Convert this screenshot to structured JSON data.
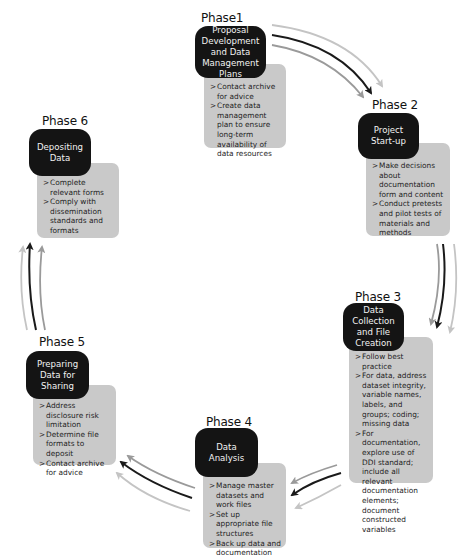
{
  "diagram": {
    "type": "cycle",
    "phases": [
      {
        "label": "Phase1",
        "title_lines": [
          "Proposal",
          "Development",
          "and Data",
          "Management",
          "Plans"
        ],
        "items": [
          "Contact archive for advice",
          "Create data management plan to ensure long-term availability of data resources"
        ]
      },
      {
        "label": "Phase 2",
        "title_lines": [
          "Project",
          "Start-up"
        ],
        "items": [
          "Make decisions about documentation form and content",
          "Conduct pretests and pilot tests of materials and methods"
        ]
      },
      {
        "label": "Phase 3",
        "title_lines": [
          "Data",
          "Collection",
          "and File",
          "Creation"
        ],
        "items": [
          "Follow best practice",
          "For data, address dataset integrity, variable names, labels, and groups; coding; missing data",
          "For documentation, explore use of DDI standard; include all relevant documentation elements; document constructed variables"
        ]
      },
      {
        "label": "Phase 4",
        "title_lines": [
          "Data",
          "Analysis"
        ],
        "items": [
          "Manage master datasets and work files",
          "Set up appropriate file structures",
          "Back up data and documentation"
        ]
      },
      {
        "label": "Phase 5",
        "title_lines": [
          "Preparing",
          "Data for",
          "Sharing"
        ],
        "items": [
          "Address disclosure risk limitation",
          "Determine file formats to deposit",
          "Contact archive for advice"
        ]
      },
      {
        "label": "Phase 6",
        "title_lines": [
          "Depositing",
          "Data"
        ],
        "items": [
          "Complete relevant forms",
          "Comply with dissemination standards and formats"
        ]
      }
    ],
    "flow": [
      "Phase1 -> Phase 2",
      "Phase 2 -> Phase 3",
      "Phase 3 -> Phase 4",
      "Phase 4 -> Phase 5",
      "Phase 5 -> Phase 6",
      "Phase 6 -> Phase1"
    ],
    "colors": {
      "title_box": "#141414",
      "title_text": "#f2f2f2",
      "detail_box": "#c9c9c9",
      "arrow_dark": "#1a1a1a",
      "arrow_mid": "#9a9a9a",
      "arrow_light": "#c4c4c4"
    }
  }
}
